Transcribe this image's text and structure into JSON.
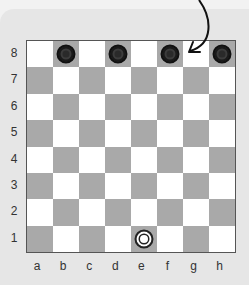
{
  "board": {
    "files": [
      "a",
      "b",
      "c",
      "d",
      "e",
      "f",
      "g",
      "h"
    ],
    "ranks": [
      "8",
      "7",
      "6",
      "5",
      "4",
      "3",
      "2",
      "1"
    ],
    "light_color": "#ffffff",
    "dark_color": "#a9a9a9",
    "pieces": [
      {
        "square": "b8",
        "color": "black"
      },
      {
        "square": "d8",
        "color": "black"
      },
      {
        "square": "f8",
        "color": "black"
      },
      {
        "square": "h8",
        "color": "black"
      },
      {
        "square": "e1",
        "color": "white"
      }
    ]
  },
  "annotation": {
    "type": "curved-arrow",
    "target_square": "g8"
  }
}
